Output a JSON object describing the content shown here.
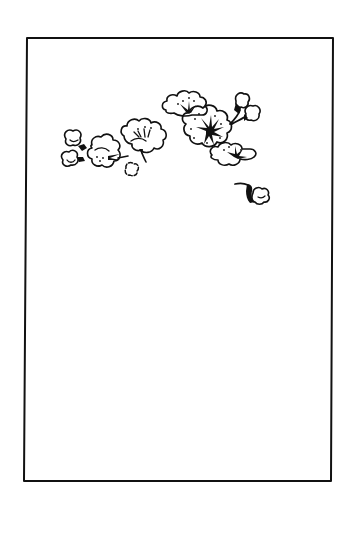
{
  "page": {
    "type": "woodblock-print illustration",
    "background_color": "#ffffff",
    "ink_color": "#111111"
  },
  "frame": {
    "top_left": [
      27,
      38
    ],
    "top_right": [
      333,
      38
    ],
    "bottom_left": [
      24,
      481
    ],
    "bottom_right": [
      331,
      481
    ],
    "stroke_width": 2
  },
  "illustration": {
    "elements": [
      {
        "name": "bud-cluster-left",
        "center": [
          80,
          150
        ]
      },
      {
        "name": "blossom-left",
        "center": [
          100,
          160
        ]
      },
      {
        "name": "small-bud",
        "center": [
          132,
          170
        ]
      },
      {
        "name": "blossom-middle",
        "center": [
          145,
          135
        ]
      },
      {
        "name": "blossom-upper",
        "center": [
          190,
          110
        ]
      },
      {
        "name": "blossom-large",
        "center": [
          210,
          130
        ]
      },
      {
        "name": "buds-top-right",
        "center": [
          248,
          110
        ]
      },
      {
        "name": "blossom-lower-right",
        "center": [
          235,
          157
        ]
      },
      {
        "name": "falling-bud",
        "center": [
          262,
          197
        ]
      }
    ]
  }
}
